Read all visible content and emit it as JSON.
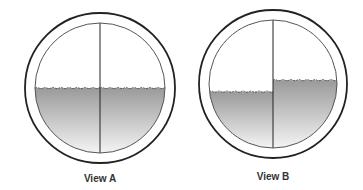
{
  "figure": {
    "type": "level-gauge-sight-glass-views",
    "views": [
      {
        "id": "A",
        "caption": "View A",
        "description": "Liquid level equal on both sides of the vertical divider",
        "left_level_fraction": 0.5,
        "right_level_fraction": 0.5
      },
      {
        "id": "B",
        "caption": "View B",
        "description": "Liquid level lower on left side, higher on right side",
        "left_level_fraction": 0.44,
        "right_level_fraction": 0.53
      }
    ],
    "colors": {
      "outline": "#222222",
      "liquid_top": "#9a9a9a",
      "liquid_bottom": "#f4f4f4",
      "background": "#ffffff"
    }
  }
}
